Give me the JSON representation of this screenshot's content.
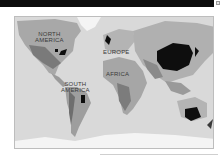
{
  "window": {
    "corner_icon": "restore-icon"
  },
  "map": {
    "type": "choropleth-world",
    "colors": {
      "ocean": "#d9d9d9",
      "land_light": "#bcbcbc",
      "land_mid": "#9c9c9c",
      "land_dark": "#6e6e6e",
      "highlight": "#0e0e0e",
      "ice": "#f4f4f4"
    },
    "labels": {
      "north_america": "NORTH\nAMERICA",
      "south_america": "SOUTH\nAMERICA",
      "europe": "EUROPE",
      "africa": "AFRICA"
    }
  }
}
